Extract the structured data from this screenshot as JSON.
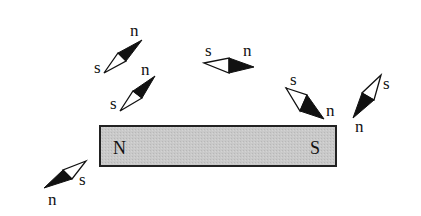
{
  "diagram": {
    "title": "",
    "magnet": {
      "left_pole": "N",
      "right_pole": "S",
      "fill": "#c8c8c8",
      "stroke": "#222222"
    },
    "compasses": [
      {
        "id": "c1",
        "s_label": "s",
        "n_label": "n"
      },
      {
        "id": "c2",
        "s_label": "s",
        "n_label": "n"
      },
      {
        "id": "c3",
        "s_label": "s",
        "n_label": "n"
      },
      {
        "id": "c4",
        "s_label": "s",
        "n_label": "n"
      },
      {
        "id": "c5",
        "s_label": "s",
        "n_label": "n"
      },
      {
        "id": "c6",
        "s_label": "s",
        "n_label": "n"
      }
    ]
  }
}
